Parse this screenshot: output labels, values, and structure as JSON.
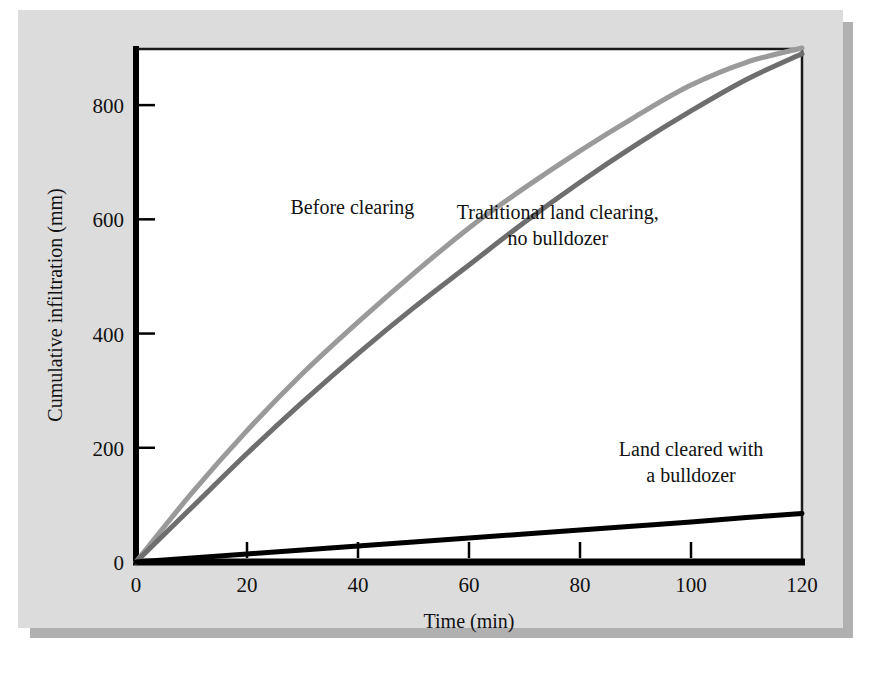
{
  "chart_data": {
    "type": "line",
    "title": "",
    "xlabel": "Time (min)",
    "ylabel": "Cumulative infiltration (mm)",
    "xlim": [
      0,
      120
    ],
    "ylim": [
      0,
      900
    ],
    "xticks": [
      0,
      20,
      40,
      60,
      80,
      100,
      120
    ],
    "xtick_labels": [
      "0",
      "20",
      "40",
      "60",
      "80",
      "100",
      "120"
    ],
    "yticks": [
      0,
      200,
      400,
      600,
      800
    ],
    "ytick_labels": [
      "0",
      "200",
      "400",
      "600",
      "800"
    ],
    "grid": false,
    "legend_position": "inline-annotations",
    "x": [
      0,
      10,
      20,
      30,
      40,
      50,
      60,
      70,
      80,
      90,
      100,
      110,
      120
    ],
    "series": [
      {
        "name": "Before clearing",
        "color": "#9a9a9a",
        "values": [
          0,
          120,
          230,
          330,
          420,
          505,
          585,
          655,
          720,
          780,
          835,
          875,
          900
        ]
      },
      {
        "name": "Traditional land clearing, no bulldozer",
        "color": "#6e6e6e",
        "values": [
          0,
          95,
          190,
          280,
          365,
          445,
          520,
          595,
          665,
          730,
          790,
          845,
          890
        ]
      },
      {
        "name": "Land cleared with a bulldozer",
        "color": "#000000",
        "values": [
          0,
          7,
          14,
          21,
          28,
          35,
          42,
          49,
          56,
          63,
          70,
          78,
          85
        ]
      }
    ],
    "annotations": [
      {
        "id": "before-clearing",
        "text": "Before clearing",
        "lines": [
          "Before clearing"
        ],
        "x": 39,
        "y": 610
      },
      {
        "id": "traditional-clearing",
        "text": "Traditional land clearing, no bulldozer",
        "lines": [
          "Traditional land clearing,",
          "no bulldozer"
        ],
        "x": 76,
        "y": 600
      },
      {
        "id": "bulldozer",
        "text": "Land cleared with a bulldozer",
        "lines": [
          "Land cleared with",
          "a bulldozer"
        ],
        "x": 100,
        "y": 185
      }
    ]
  },
  "figure": {
    "panel_color": "#dcdcdc",
    "plot_background": "#ffffff",
    "axis_color": "#000000",
    "shadow_color": "#b0b0b0"
  }
}
